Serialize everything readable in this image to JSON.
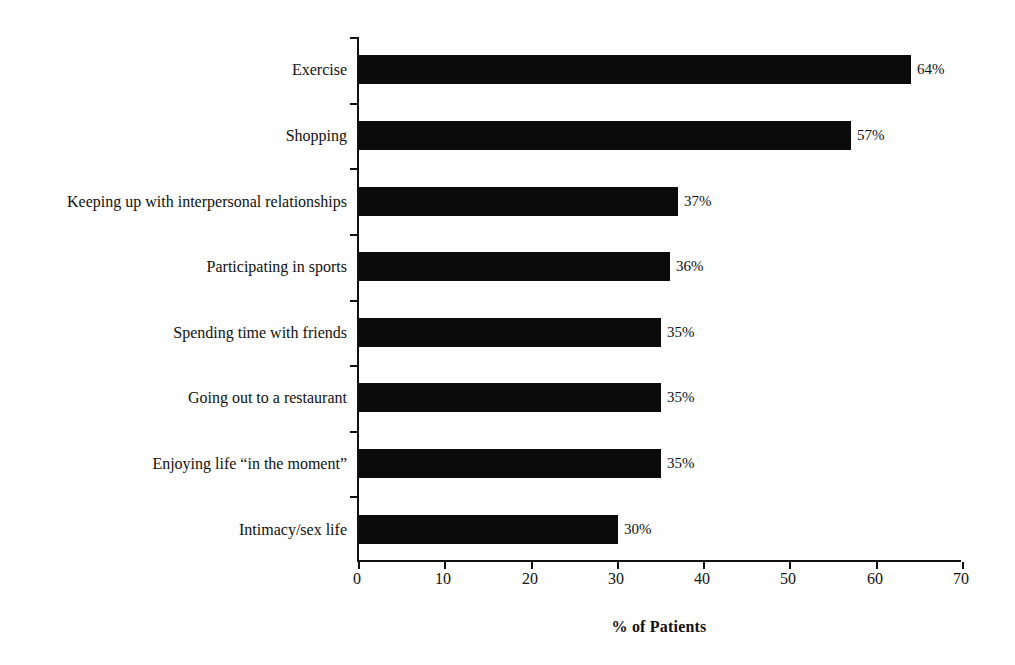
{
  "page": {
    "background": "#fefefe"
  },
  "chart_data": {
    "type": "bar",
    "orientation": "horizontal",
    "title": "",
    "xlabel": "% of Patients",
    "ylabel": "",
    "categories": [
      "Exercise",
      "Shopping",
      "Keeping up with interpersonal relationships",
      "Participating in sports",
      "Spending time with friends",
      "Going out to a restaurant",
      "Enjoying life “in the moment”",
      "Intimacy/sex life"
    ],
    "values": [
      64,
      57,
      37,
      36,
      35,
      35,
      35,
      30
    ],
    "value_labels": [
      "64%",
      "57%",
      "37%",
      "36%",
      "35%",
      "35%",
      "35%",
      "30%"
    ],
    "xlim": [
      0,
      70
    ],
    "xticks": [
      0,
      10,
      20,
      30,
      40,
      50,
      60,
      70
    ],
    "xtick_labels": [
      "0",
      "10",
      "20",
      "30",
      "40",
      "50",
      "60",
      "70"
    ],
    "bar_color": "#0b0b0b",
    "axis_color": "#111111",
    "grid": false,
    "legend": null
  }
}
